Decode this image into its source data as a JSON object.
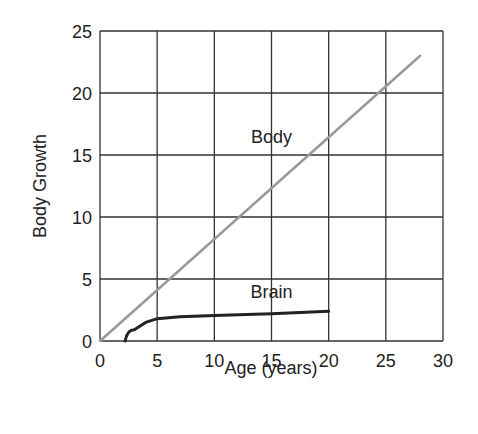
{
  "chart_data": {
    "type": "line",
    "title": "",
    "xlabel": "Age (years)",
    "ylabel": "Body Growth",
    "xlim": [
      0,
      30
    ],
    "ylim": [
      0,
      25
    ],
    "xticks": [
      "0",
      "5",
      "10",
      "15",
      "20",
      "25",
      "30"
    ],
    "yticks": [
      "0",
      "5",
      "10",
      "15",
      "20",
      "25"
    ],
    "grid": true,
    "legend": "none (inline labels)",
    "series": [
      {
        "name": "Body",
        "color": "#999999",
        "x": [
          0,
          28
        ],
        "y": [
          0,
          23
        ]
      },
      {
        "name": "Brain",
        "color": "#222222",
        "x": [
          2.2,
          3,
          4,
          5,
          7,
          10,
          15,
          20
        ],
        "y": [
          0,
          0.9,
          1.5,
          1.8,
          1.95,
          2.05,
          2.2,
          2.4
        ]
      }
    ],
    "annotations": [
      {
        "text": "Body",
        "x": 15,
        "y": 16
      },
      {
        "text": "Brain",
        "x": 15,
        "y": 3.5
      }
    ]
  }
}
